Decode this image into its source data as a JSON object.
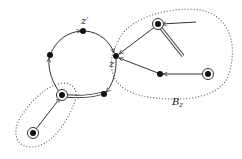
{
  "diagram": {
    "labels": {
      "z_prime": "z′",
      "z": "z",
      "region_B": "B",
      "region_B_sub": "z"
    },
    "colors": {
      "stroke": "#333333",
      "node_fill": "#111111",
      "dotted_region": "#555555",
      "background": "#ffffff"
    },
    "nodes": [
      {
        "id": "z_prime",
        "x": 83,
        "y": 31,
        "type": "filled"
      },
      {
        "id": "left",
        "x": 50,
        "y": 55,
        "type": "filled"
      },
      {
        "id": "z",
        "x": 116,
        "y": 56,
        "type": "filled"
      },
      {
        "id": "bottom_circle",
        "x": 104,
        "y": 94,
        "type": "filled"
      },
      {
        "id": "hub_bottom_left",
        "x": 62,
        "y": 95,
        "type": "double"
      },
      {
        "id": "lone_bottom_left",
        "x": 33,
        "y": 133,
        "type": "double"
      },
      {
        "id": "top_right",
        "x": 158,
        "y": 24,
        "type": "double"
      },
      {
        "id": "mid_right",
        "x": 160,
        "y": 74,
        "type": "filled"
      },
      {
        "id": "far_right",
        "x": 208,
        "y": 74,
        "type": "double"
      }
    ],
    "regions": [
      {
        "id": "B_z",
        "label": "B_z"
      },
      {
        "id": "bottom_left_region",
        "label": ""
      }
    ]
  }
}
